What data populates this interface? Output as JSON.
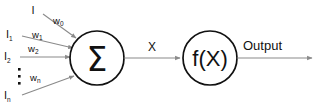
{
  "diagram": {
    "colors": {
      "line": "#8a8a8a",
      "stroke": "#111111",
      "background": "#ffffff"
    },
    "inputs": [
      {
        "label": "I",
        "sub": "",
        "weight": "w",
        "weight_sub": "0"
      },
      {
        "label": "I",
        "sub": "1",
        "weight": "w",
        "weight_sub": "1"
      },
      {
        "label": "I",
        "sub": "2",
        "weight": "w",
        "weight_sub": "2"
      },
      {
        "label": "I",
        "sub": "n",
        "weight": "w",
        "weight_sub": "n"
      }
    ],
    "ellipsis": "⋮",
    "summation": {
      "glyph": "Σ",
      "name": "summation"
    },
    "intermediate": {
      "label": "X"
    },
    "activation": {
      "f": "f",
      "open_paren": "(",
      "arg": "X",
      "close_paren": ")"
    },
    "output": {
      "label": "Output"
    }
  }
}
